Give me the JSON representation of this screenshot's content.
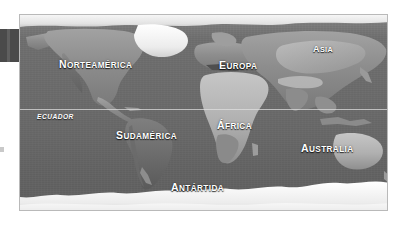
{
  "page": {
    "background_color": "#ffffff",
    "type": "world-map-figure",
    "language": "es"
  },
  "map": {
    "frame_border_color": "#b9b9b9",
    "ocean_color": "#6b6b6b",
    "land_color": "#8e8e8e",
    "ice_color": "#f2f2f2",
    "label_color": "#ffffff",
    "equator": {
      "label": "ECUADOR",
      "line_color": "#e1e1e1"
    },
    "labels": [
      {
        "id": "norteamerica",
        "initial": "N",
        "rest": "ORTEAMÉRICA",
        "full": "NORTEAMÉRICA"
      },
      {
        "id": "europa",
        "initial": "E",
        "rest": "UROPA",
        "full": "EUROPA"
      },
      {
        "id": "asia",
        "initial": "A",
        "rest": "SIA",
        "full": "ASIA"
      },
      {
        "id": "sudamerica",
        "initial": "S",
        "rest": "UDAMÉRICA",
        "full": "SUDAMÉRICA"
      },
      {
        "id": "africa",
        "initial": "Á",
        "rest": "FRICA",
        "full": "ÁFRICA"
      },
      {
        "id": "australia",
        "initial": "A",
        "rest": "USTRALIA",
        "full": "AUSTRALIA"
      },
      {
        "id": "antartida",
        "initial": "A",
        "rest": "NTÁRTIDA",
        "full": "ANTÁRTIDA"
      }
    ]
  },
  "edge": {
    "tab_color": "#4a4a4a"
  }
}
